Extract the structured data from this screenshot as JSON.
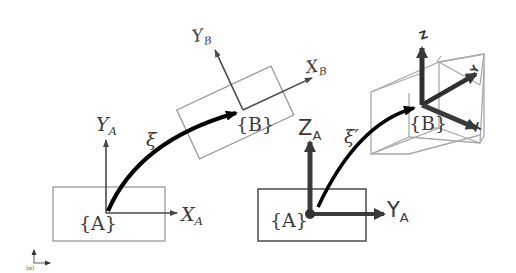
{
  "left_diagram": {
    "frame_a": {
      "label": "{A}",
      "x_axis": "X",
      "x_sub": "A",
      "y_axis": "Y",
      "y_sub": "A"
    },
    "frame_b": {
      "label": "{B}",
      "x_axis": "X",
      "x_sub": "B",
      "y_axis": "Y",
      "y_sub": "B"
    },
    "transform_label": "ξ"
  },
  "right_diagram": {
    "frame_a": {
      "label": "{A}",
      "z_axis": "Z",
      "z_sub": "A",
      "y_axis": "Y",
      "y_sub": "A"
    },
    "frame_b": {
      "label": "{B}"
    },
    "transform_label": "ξ′"
  },
  "origin_marker": {
    "label": "(o)"
  },
  "colors": {
    "ink": "#000000",
    "axis": "#4a4a4a",
    "box": "#9a9a9a",
    "box_dark": "#555555"
  }
}
